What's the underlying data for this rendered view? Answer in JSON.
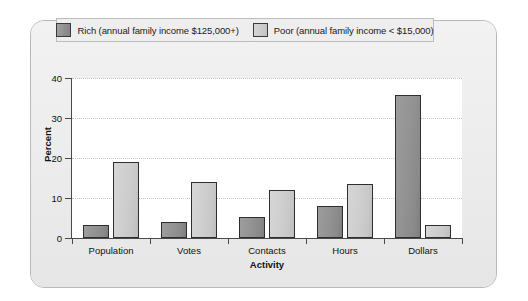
{
  "chart_data": {
    "type": "bar",
    "title": "",
    "xlabel": "Activity",
    "ylabel": "Percent",
    "categories": [
      "Population",
      "Votes",
      "Contacts",
      "Hours",
      "Dollars"
    ],
    "series": [
      {
        "name": "Rich (annual family income $125,000+)",
        "color": "#939393",
        "values": [
          3.3,
          4.0,
          5.3,
          8.0,
          35.7
        ]
      },
      {
        "name": "Poor (annual family income < $15,000)",
        "color": "#cfcfcf",
        "values": [
          19.0,
          14.0,
          12.0,
          13.5,
          3.3
        ]
      }
    ],
    "ylim": [
      0,
      40
    ],
    "yticks": [
      "0",
      "10",
      "20",
      "30",
      "40"
    ],
    "ytick_values": [
      0,
      10,
      20,
      30,
      40
    ],
    "grid": true,
    "legend_position": "top"
  },
  "legend": {
    "entries": [
      {
        "label": "Rich (annual family income $125,000+)",
        "swatch": "rich-swatch"
      },
      {
        "label": "Poor (annual family income < $15,000)",
        "swatch": "poor-swatch"
      }
    ]
  },
  "axes": {
    "y_title": "Percent",
    "x_title": "Activity"
  },
  "colors": {
    "panel_background": "#eeeeee",
    "plot_background": "#ffffff",
    "rich_bar": "#939393",
    "poor_bar": "#cfcfcf",
    "axis": "#4a4a4a",
    "gridline": "#c4c4c4"
  }
}
